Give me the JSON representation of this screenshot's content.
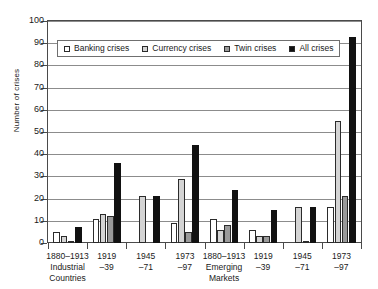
{
  "chart_data": {
    "type": "bar",
    "title": "",
    "xlabel": "",
    "ylabel": "Number of crises",
    "ylim": [
      0,
      100
    ],
    "yticks": [
      0,
      10,
      20,
      30,
      40,
      50,
      60,
      70,
      80,
      90,
      100
    ],
    "grid": true,
    "legend_position": "inside-top-left",
    "categories": [
      "1880–1913 Industrial Countries",
      "1919–39",
      "1945–71",
      "1973–97",
      "1880–1913 Emerging Markets",
      "1919–39",
      "1945–71",
      "1973–97"
    ],
    "category_lines": [
      [
        "1880–1913",
        "Industrial",
        "Countries"
      ],
      [
        "1919",
        "–39"
      ],
      [
        "1945",
        "–71"
      ],
      [
        "1973",
        "–97"
      ],
      [
        "1880–1913",
        "Emerging",
        "Markets"
      ],
      [
        "1919",
        "–39"
      ],
      [
        "1945",
        "–71"
      ],
      [
        "1973",
        "–97"
      ]
    ],
    "series": [
      {
        "name": "Banking crises",
        "color": "#ffffff",
        "values": [
          5,
          11,
          0,
          9,
          11,
          6,
          0,
          16
        ]
      },
      {
        "name": "Currency crises",
        "color": "#d4d4d4",
        "values": [
          3,
          13,
          21,
          29,
          6,
          3,
          16,
          55
        ]
      },
      {
        "name": "Twin crises",
        "color": "#9a9a9a",
        "values": [
          1,
          12,
          0,
          5,
          8,
          3,
          1,
          21
        ]
      },
      {
        "name": "All crises",
        "color": "#111111",
        "values": [
          7,
          36,
          21,
          44,
          24,
          15,
          16,
          93
        ]
      }
    ]
  },
  "legend": {
    "items": [
      {
        "label": "Banking crises"
      },
      {
        "label": "Currency crises"
      },
      {
        "label": "Twin crises"
      },
      {
        "label": "All crises"
      }
    ]
  },
  "axis": {
    "y_title": "Number of crises",
    "y_tick_labels": [
      "100",
      "90",
      "80",
      "70",
      "60",
      "50",
      "40",
      "30",
      "20",
      "10",
      "0"
    ]
  }
}
